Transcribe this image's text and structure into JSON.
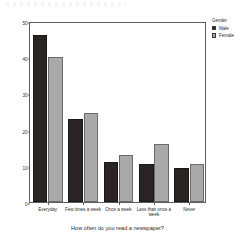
{
  "chart_data": {
    "type": "bar",
    "title": "",
    "xlabel": "How often do you read a newspaper?",
    "ylabel": "Percent",
    "categories": [
      "Everyday",
      "Few times a week",
      "Once a week",
      "Less than once a week",
      "Never"
    ],
    "series": [
      {
        "name": "Male",
        "color": "#2b2424",
        "values": [
          46,
          23,
          11,
          10.5,
          9.5
        ]
      },
      {
        "name": "Female",
        "color": "#a9a9a9",
        "values": [
          40,
          24.5,
          13,
          16,
          10.5
        ]
      }
    ],
    "ylim": [
      0,
      50
    ],
    "yticks": [
      0,
      10,
      20,
      30,
      40,
      50
    ],
    "ytick_labels": [
      "0",
      "10",
      "20",
      "30",
      "40",
      "50"
    ],
    "grid": false,
    "legend": {
      "title": "Gender",
      "position": "right",
      "entries": [
        "Male",
        "Female"
      ]
    }
  }
}
